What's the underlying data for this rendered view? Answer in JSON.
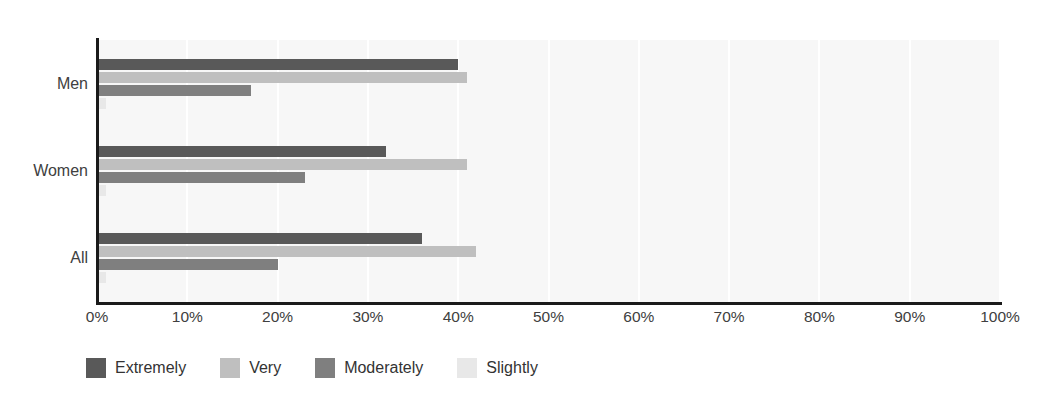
{
  "chart_data": {
    "type": "bar",
    "orientation": "horizontal",
    "title": "",
    "xlabel": "",
    "ylabel": "",
    "categories": [
      "Men",
      "Women",
      "All"
    ],
    "series": [
      {
        "name": "Extremely",
        "color": "#595959",
        "values": [
          40,
          32,
          36
        ]
      },
      {
        "name": "Very",
        "color": "#bfbfbf",
        "values": [
          41,
          41,
          42
        ]
      },
      {
        "name": "Moderately",
        "color": "#7f7f7f",
        "values": [
          17,
          23,
          20
        ]
      },
      {
        "name": "Slightly",
        "color": "#e8e8e8",
        "values": [
          1,
          1,
          1
        ]
      }
    ],
    "xlim": [
      0,
      100
    ],
    "xticks": [
      0,
      10,
      20,
      30,
      40,
      50,
      60,
      70,
      80,
      90,
      100
    ],
    "xtick_labels": [
      "0%",
      "10%",
      "20%",
      "30%",
      "40%",
      "50%",
      "60%",
      "70%",
      "80%",
      "90%",
      "100%"
    ],
    "grid": true,
    "grid_axis": "x",
    "legend_position": "bottom-left",
    "plot_background": "#f7f7f7",
    "axis_color": "#1a1a1a"
  },
  "legend": {
    "items": [
      {
        "label": "Extremely",
        "color": "#595959"
      },
      {
        "label": "Very",
        "color": "#bfbfbf"
      },
      {
        "label": "Moderately",
        "color": "#7f7f7f"
      },
      {
        "label": "Slightly",
        "color": "#e8e8e8"
      }
    ]
  },
  "axes": {
    "y_categories": [
      "Men",
      "Women",
      "All"
    ],
    "x_tick_labels": [
      "0%",
      "10%",
      "20%",
      "30%",
      "40%",
      "50%",
      "60%",
      "70%",
      "80%",
      "90%",
      "100%"
    ]
  }
}
